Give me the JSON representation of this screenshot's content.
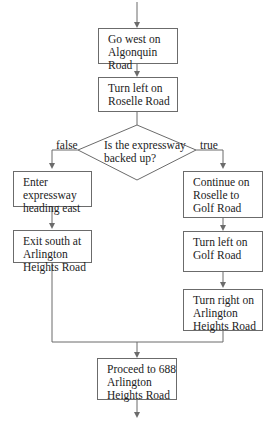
{
  "flowchart": {
    "nodes": {
      "go_west": "Go west on Algonquin Road",
      "turn_left_roselle": "Turn left on Roselle Road",
      "decision": {
        "line1": "Is the expressway",
        "line2": "backed up?"
      },
      "enter_expressway": "Enter expressway heading east",
      "exit_south": "Exit south at Arlington Heights Road",
      "continue_roselle": "Continue on Roselle to Golf Road",
      "turn_left_golf": "Turn left on Golf Road",
      "turn_right_arlington": "Turn right on Arlington Heights Road",
      "proceed": "Proceed to 688 Arlington Heights Road"
    },
    "branch_labels": {
      "false": "false",
      "true": "true"
    },
    "colors": {
      "line": "#6b6b6b",
      "text": "#222222",
      "background": "#ffffff"
    }
  }
}
